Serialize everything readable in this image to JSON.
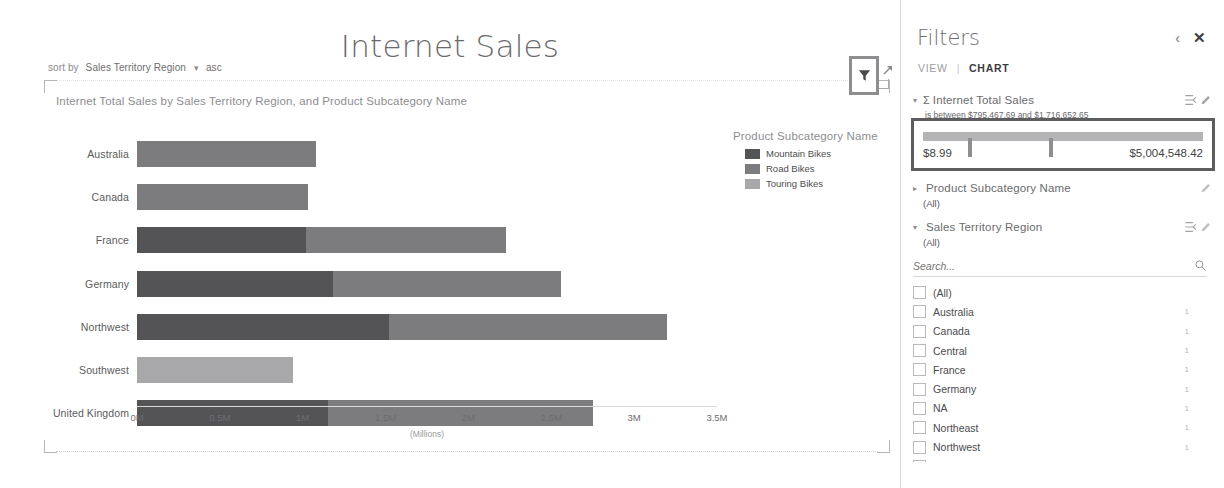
{
  "report": {
    "title": "Internet Sales",
    "sort_by": {
      "label": "sort by",
      "field": "Sales Territory Region",
      "caret": "chevron-down-icon",
      "direction": "asc"
    },
    "chart_subtitle": "Internet Total Sales by Sales Territory Region, and Product Subcategory Name",
    "filter_button_icon": "funnel-icon",
    "expand_icon": "expand-arrow-icon"
  },
  "chart_data": {
    "type": "bar",
    "orientation": "horizontal",
    "stacked": true,
    "title": "Internet Total Sales by Sales Territory Region, and Product Subcategory Name",
    "xlabel": "(Millions)",
    "ylabel": "",
    "xlim": [
      0,
      3.5
    ],
    "xticks": [
      "0M",
      "0.5M",
      "1M",
      "1.5M",
      "2M",
      "2.5M",
      "3M",
      "3.5M"
    ],
    "xtick_values": [
      0,
      0.5,
      1,
      1.5,
      2,
      2.5,
      3,
      3.5
    ],
    "grid": false,
    "legend_title": "Product Subcategory Name",
    "legend_position": "right",
    "categories": [
      "Australia",
      "Canada",
      "France",
      "Germany",
      "Northwest",
      "Southwest",
      "United Kingdom"
    ],
    "series": [
      {
        "name": "Mountain Bikes",
        "color": "#545457",
        "values": [
          0.0,
          0.0,
          1.02,
          1.18,
          1.52,
          0.0,
          1.15
        ]
      },
      {
        "name": "Road Bikes",
        "color": "#7c7c7f",
        "values": [
          1.08,
          1.03,
          1.21,
          1.38,
          1.68,
          0.0,
          1.6
        ]
      },
      {
        "name": "Touring Bikes",
        "color": "#a8a8ab",
        "values": [
          0.0,
          0.0,
          0.0,
          0.0,
          0.0,
          0.94,
          0.0
        ]
      }
    ],
    "totals": [
      1.08,
      1.03,
      2.23,
      2.56,
      3.2,
      0.94,
      2.75
    ]
  },
  "filters": {
    "title": "Filters",
    "collapse_icon": "chevron-left-icon",
    "close_icon": "close-icon",
    "tabs": {
      "view": "VIEW",
      "separator": "|",
      "chart": "CHART"
    },
    "measure_filter": {
      "expander": "triangle-down-icon",
      "sigma": "sigma-icon",
      "name": "Internet Total Sales",
      "condition": "is between $795,467.69 and $1,716,652.65",
      "reset_icon": "reset-filter-icon",
      "edit_icon": "pencil-icon",
      "slider_min_label": "$8.99",
      "slider_max_label": "$5,004,548.42",
      "handle_positions_pct": [
        16,
        45
      ]
    },
    "subcategory_filter": {
      "expander": "triangle-right-icon",
      "name": "Product Subcategory Name",
      "value": "(All)",
      "edit_icon": "pencil-icon"
    },
    "region_filter": {
      "expander": "triangle-down-icon",
      "name": "Sales Territory Region",
      "value": "(All)",
      "reset_icon": "reset-filter-icon",
      "edit_icon": "pencil-icon",
      "search_placeholder": "Search...",
      "search_value": "",
      "search_icon": "search-icon",
      "options": [
        {
          "label": "(All)",
          "count": "",
          "checked": false
        },
        {
          "label": "Australia",
          "count": "1",
          "checked": false
        },
        {
          "label": "Canada",
          "count": "1",
          "checked": false
        },
        {
          "label": "Central",
          "count": "1",
          "checked": false
        },
        {
          "label": "France",
          "count": "1",
          "checked": false
        },
        {
          "label": "Germany",
          "count": "1",
          "checked": false
        },
        {
          "label": "NA",
          "count": "1",
          "checked": false
        },
        {
          "label": "Northeast",
          "count": "1",
          "checked": false
        },
        {
          "label": "Northwest",
          "count": "1",
          "checked": false
        },
        {
          "label": "Southeast",
          "count": "1",
          "checked": false
        }
      ]
    }
  },
  "colors": {
    "highlight_border": "#5d5d5f",
    "text": "#59595b",
    "panel_border": "#d9d9db"
  }
}
